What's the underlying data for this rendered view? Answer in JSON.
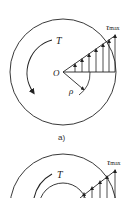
{
  "diagram": {
    "colors": {
      "stroke": "#222222",
      "background": "#ffffff"
    },
    "figure_a": {
      "caption": "a)",
      "torque_label": "T",
      "center_label": "O",
      "radius_label": "ρ",
      "stress_label_symbol": "τ",
      "stress_label_sub": "max",
      "section": "solid circle"
    },
    "figure_b": {
      "torque_label": "T",
      "stress_label_symbol": "τ",
      "stress_label_sub": "max",
      "section": "hollow (annular) circle"
    }
  }
}
